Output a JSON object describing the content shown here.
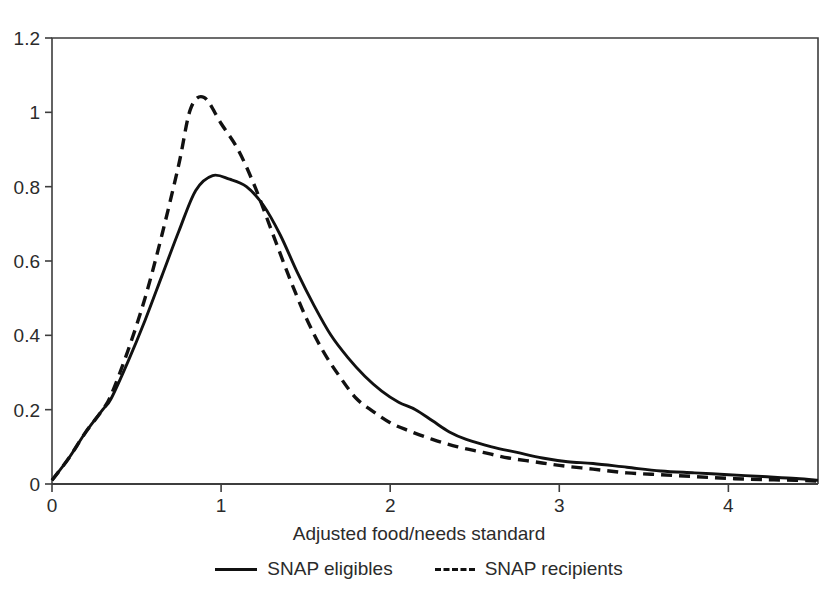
{
  "chart_data": {
    "type": "line",
    "title": "",
    "xlabel": "Adjusted food/needs standard",
    "ylabel": "",
    "xlim": [
      0,
      4.53
    ],
    "ylim": [
      0,
      1.2
    ],
    "grid": false,
    "legend_position": "bottom",
    "xticks": [
      "0",
      "1",
      "2",
      "3",
      "4"
    ],
    "xtick_values": [
      0,
      1,
      2,
      3,
      4
    ],
    "yticks": [
      "0",
      "0.2",
      "0.4",
      "0.6",
      "0.8",
      "1",
      "1.2"
    ],
    "ytick_values": [
      0,
      0.2,
      0.4,
      0.6,
      0.8,
      1,
      1.2
    ],
    "series": [
      {
        "name": "SNAP eligibles",
        "style": "solid",
        "color": "#111111",
        "x": [
          0.0,
          0.1,
          0.2,
          0.3,
          0.35,
          0.45,
          0.55,
          0.65,
          0.75,
          0.85,
          0.95,
          1.05,
          1.15,
          1.25,
          1.35,
          1.45,
          1.55,
          1.65,
          1.75,
          1.85,
          1.95,
          2.05,
          2.15,
          2.25,
          2.35,
          2.45,
          2.6,
          2.75,
          2.9,
          3.05,
          3.2,
          3.4,
          3.6,
          3.8,
          4.0,
          4.2,
          4.4,
          4.53
        ],
        "y": [
          0.01,
          0.07,
          0.14,
          0.2,
          0.23,
          0.33,
          0.44,
          0.56,
          0.68,
          0.79,
          0.83,
          0.82,
          0.8,
          0.75,
          0.67,
          0.57,
          0.48,
          0.4,
          0.34,
          0.29,
          0.25,
          0.22,
          0.2,
          0.17,
          0.14,
          0.12,
          0.1,
          0.085,
          0.07,
          0.06,
          0.055,
          0.045,
          0.035,
          0.03,
          0.025,
          0.02,
          0.015,
          0.01
        ]
      },
      {
        "name": "SNAP recipients",
        "style": "dashed",
        "color": "#111111",
        "x": [
          0.0,
          0.1,
          0.2,
          0.3,
          0.35,
          0.45,
          0.55,
          0.65,
          0.75,
          0.82,
          0.9,
          1.0,
          1.1,
          1.2,
          1.3,
          1.4,
          1.5,
          1.6,
          1.7,
          1.8,
          1.9,
          2.0,
          2.1,
          2.25,
          2.4,
          2.55,
          2.7,
          2.85,
          3.0,
          3.2,
          3.4,
          3.6,
          3.8,
          4.0,
          4.2,
          4.4,
          4.53
        ],
        "y": [
          0.01,
          0.07,
          0.14,
          0.2,
          0.24,
          0.36,
          0.5,
          0.67,
          0.86,
          1.01,
          1.04,
          0.97,
          0.9,
          0.8,
          0.68,
          0.56,
          0.45,
          0.36,
          0.29,
          0.23,
          0.195,
          0.165,
          0.145,
          0.12,
          0.1,
          0.085,
          0.07,
          0.06,
          0.05,
          0.04,
          0.03,
          0.025,
          0.02,
          0.015,
          0.012,
          0.01,
          0.008
        ]
      }
    ],
    "annotations": []
  },
  "legend": {
    "items": [
      {
        "label": "SNAP eligibles",
        "style": "solid"
      },
      {
        "label": "SNAP recipients",
        "style": "dashed"
      }
    ]
  },
  "axes": {
    "x_label": "Adjusted food/needs standard"
  }
}
